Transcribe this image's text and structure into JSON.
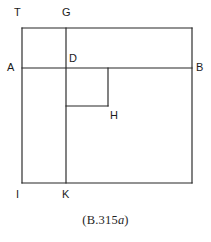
{
  "figure": {
    "caption_prefix": "(B.315",
    "caption_italic": "a",
    "caption_suffix": ")",
    "caption_full": "(B.315a)",
    "stroke_color": "#262626",
    "background_color": "#ffffff",
    "labels": [
      {
        "id": "T",
        "text": "T",
        "x": 14,
        "y": 7
      },
      {
        "id": "G",
        "text": "G",
        "x": 62,
        "y": 7
      },
      {
        "id": "D",
        "text": "D",
        "x": 69,
        "y": 53
      },
      {
        "id": "A",
        "text": "A",
        "x": 7,
        "y": 62
      },
      {
        "id": "B",
        "text": "B",
        "x": 196,
        "y": 62
      },
      {
        "id": "H",
        "text": "H",
        "x": 110,
        "y": 110
      },
      {
        "id": "I",
        "text": "I",
        "x": 16,
        "y": 189
      },
      {
        "id": "K",
        "text": "K",
        "x": 62,
        "y": 189
      }
    ],
    "segments": [
      {
        "name": "outer-rect-top-TB",
        "x1": 22,
        "y1": 28,
        "x2": 192,
        "y2": 28
      },
      {
        "name": "outer-rect-right-BK",
        "x1": 192,
        "y1": 28,
        "x2": 192,
        "y2": 183
      },
      {
        "name": "outer-rect-bottom-IK",
        "x1": 192,
        "y1": 183,
        "x2": 22,
        "y2": 183
      },
      {
        "name": "outer-rect-left-TI",
        "x1": 22,
        "y1": 183,
        "x2": 22,
        "y2": 28
      },
      {
        "name": "horizontal-AB",
        "x1": 22,
        "y1": 68,
        "x2": 192,
        "y2": 68
      },
      {
        "name": "vertical-GK",
        "x1": 66,
        "y1": 28,
        "x2": 66,
        "y2": 183
      },
      {
        "name": "inner-square-right-DH",
        "x1": 108,
        "y1": 68,
        "x2": 108,
        "y2": 106
      },
      {
        "name": "inner-square-bottom",
        "x1": 108,
        "y1": 106,
        "x2": 66,
        "y2": 106
      }
    ]
  }
}
